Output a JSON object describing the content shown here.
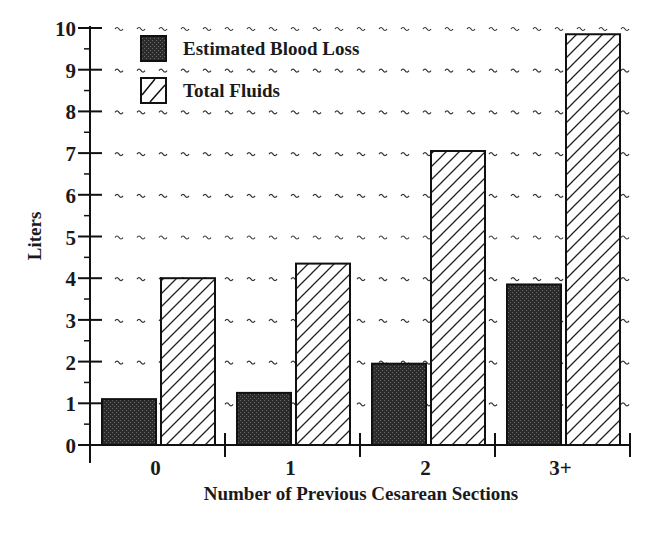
{
  "chart_data": {
    "type": "bar",
    "title": "",
    "xlabel": "Number of Previous Cesarean Sections",
    "ylabel": "Liters",
    "categories": [
      "0",
      "1",
      "2",
      "3+"
    ],
    "series": [
      {
        "name": "Estimated Blood Loss",
        "values": [
          1.1,
          1.25,
          1.95,
          3.85
        ],
        "pattern": "dark-stipple",
        "color": "#2a2a2a"
      },
      {
        "name": "Total Fluids",
        "values": [
          4.0,
          4.35,
          7.05,
          9.85
        ],
        "pattern": "diagonal-hatch",
        "color": "#ffffff"
      }
    ],
    "ylim": [
      0,
      10
    ],
    "yticks": [
      "0",
      "1",
      "2",
      "3",
      "4",
      "5",
      "6",
      "7",
      "8",
      "9",
      "10"
    ],
    "grid": true,
    "grid_style": "dashed-tilde",
    "legend_position": "top-left-inside"
  },
  "legend": {
    "items": [
      {
        "label": "Estimated Blood Loss",
        "swatch": "dark-stipple"
      },
      {
        "label": "Total Fluids",
        "swatch": "diagonal-hatch"
      }
    ]
  },
  "axes": {
    "x_title": "Number of Previous Cesarean Sections",
    "y_title": "Liters"
  }
}
